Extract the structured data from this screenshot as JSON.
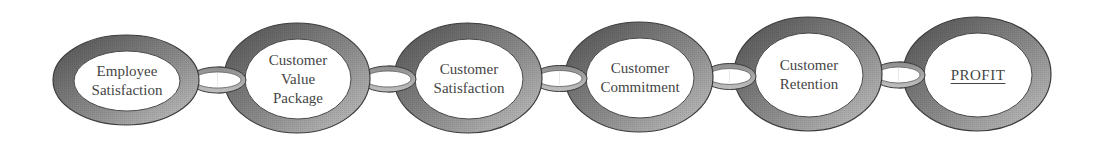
{
  "diagram": {
    "type": "chain-of-links",
    "colors": {
      "ring_dark": "#4f4f4f",
      "ring_light": "#c4c4c4",
      "ring_outline": "#3c3c3c",
      "link_fill": "#a9a9a9",
      "text": "#454545",
      "background": "#ffffff"
    },
    "nodes": [
      {
        "id": "employee-satisfaction",
        "lines": [
          "Employee",
          "Satisfaction"
        ],
        "underline": false
      },
      {
        "id": "customer-value-package",
        "lines": [
          "Customer",
          "Value",
          "Package"
        ],
        "underline": false
      },
      {
        "id": "customer-satisfaction",
        "lines": [
          "Customer",
          "Satisfaction"
        ],
        "underline": false
      },
      {
        "id": "customer-commitment",
        "lines": [
          "Customer",
          "Commitment"
        ],
        "underline": false
      },
      {
        "id": "customer-retention",
        "lines": [
          "Customer",
          "Retention"
        ],
        "underline": false
      },
      {
        "id": "profit",
        "lines": [
          "PROFIT"
        ],
        "underline": true
      }
    ],
    "edges": [
      {
        "from": "employee-satisfaction",
        "to": "customer-value-package"
      },
      {
        "from": "customer-value-package",
        "to": "customer-satisfaction"
      },
      {
        "from": "customer-satisfaction",
        "to": "customer-commitment"
      },
      {
        "from": "customer-commitment",
        "to": "customer-retention"
      },
      {
        "from": "customer-retention",
        "to": "profit"
      }
    ]
  }
}
